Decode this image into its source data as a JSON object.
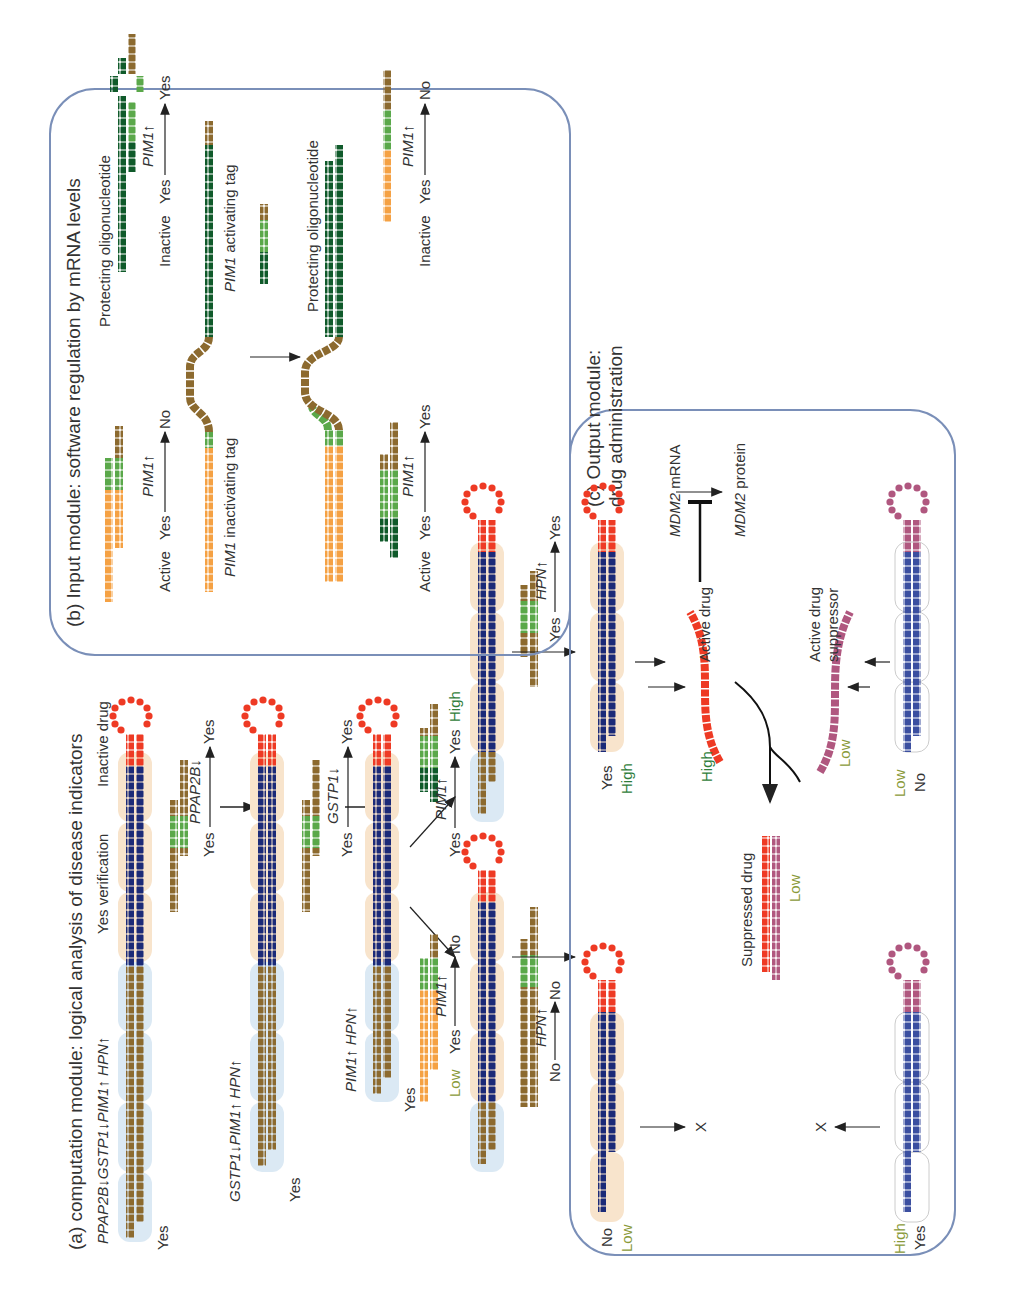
{
  "figure": {
    "orientation": "rotated-90-ccw",
    "colors": {
      "brown": "#8c6a2f",
      "navy": "#1b2a78",
      "red": "#ee3a24",
      "orange": "#f5a143",
      "light_green": "#5aa84a",
      "dark_green": "#0f5a2a",
      "magenta": "#b0577f",
      "blue_strand": "#3b4fa0",
      "peach_bg": "#f8e4cc",
      "lightblue_bg": "#dbe9f4",
      "panel_border": "#7a8fb8",
      "high_label": "#2f7d3a",
      "low_label": "#8a9a3a"
    }
  },
  "panel_a": {
    "title": "(a) computation module: logical analysis of disease indicators",
    "step1": {
      "genes": "PPAP2B↓GSTP1↓PIM1↑ HPN↑",
      "state": "Yes",
      "verification": "Yes verification",
      "drug": "Inactive drug",
      "transition": {
        "from": "Yes",
        "gene": "PPAP2B↓",
        "to": "Yes"
      }
    },
    "step2": {
      "genes": "GSTP1↓PIM1↑ HPN↑",
      "state": "Yes",
      "transition": {
        "from": "Yes",
        "gene": "GSTP1↓",
        "to": "Yes"
      }
    },
    "step3": {
      "genes": "PIM1↑ HPN↑",
      "state": "Yes",
      "branch_low": {
        "level": "Low",
        "from": "Yes",
        "gene": "PIM1↑",
        "to": "No"
      },
      "branch_high": {
        "from": "Yes",
        "gene": "PIM1↑",
        "to": "Yes",
        "level": "High"
      }
    },
    "step4": {
      "low_transition": {
        "from": "No",
        "gene": "HPN↑",
        "to": "No"
      },
      "high_transition": {
        "from": "Yes",
        "gene": "HPN↑",
        "to": "Yes"
      }
    }
  },
  "panel_b": {
    "title": "(b) Input module: software regulation by mRNA levels",
    "active_row1": {
      "state": "Active",
      "from": "Yes",
      "gene": "PIM1↑",
      "to": "No"
    },
    "inactive_row1": {
      "protecting": "Protecting oligonucleotide",
      "state": "Inactive",
      "from": "Yes",
      "gene": "PIM1↑",
      "to": "Yes"
    },
    "inactivating_tag": "PIM1 inactivating tag",
    "inactivating_tag_gene": "PIM1",
    "inactivating_tag_rest": " inactivating tag",
    "activating_tag_gene": "PIM1",
    "activating_tag_rest": " activating tag",
    "protecting2": "Protecting oligonucleotide",
    "active_row2": {
      "state": "Active",
      "from": "Yes",
      "gene": "PIM1↑",
      "to": "Yes"
    },
    "inactive_row2": {
      "state": "Inactive",
      "from": "Yes",
      "gene": "PIM1↑",
      "to": "No"
    }
  },
  "panel_c": {
    "title_line1": "(c) Output module:",
    "title_line2": "drug administration",
    "mdm2_mrna_gene": "MDM2",
    "mdm2_mrna_rest": " mRNA",
    "mdm2_protein_gene": "MDM2",
    "mdm2_protein_rest": " protein",
    "active_drug": "Active drug",
    "active_drug_level": "High",
    "active_suppressor_line1": "Active drug",
    "active_suppressor_line2": "suppressor",
    "suppressor_level": "Low",
    "suppressed_drug": "Suppressed drug",
    "suppressed_level": "Low",
    "left_top": {
      "state": "Yes",
      "level": "High"
    },
    "left_bottom": {
      "state": "No",
      "level": "Low"
    },
    "right_top": {
      "level": "Low",
      "state": "No"
    },
    "right_bottom": {
      "level": "High",
      "state": "Yes"
    },
    "blocked_symbol": "X"
  }
}
